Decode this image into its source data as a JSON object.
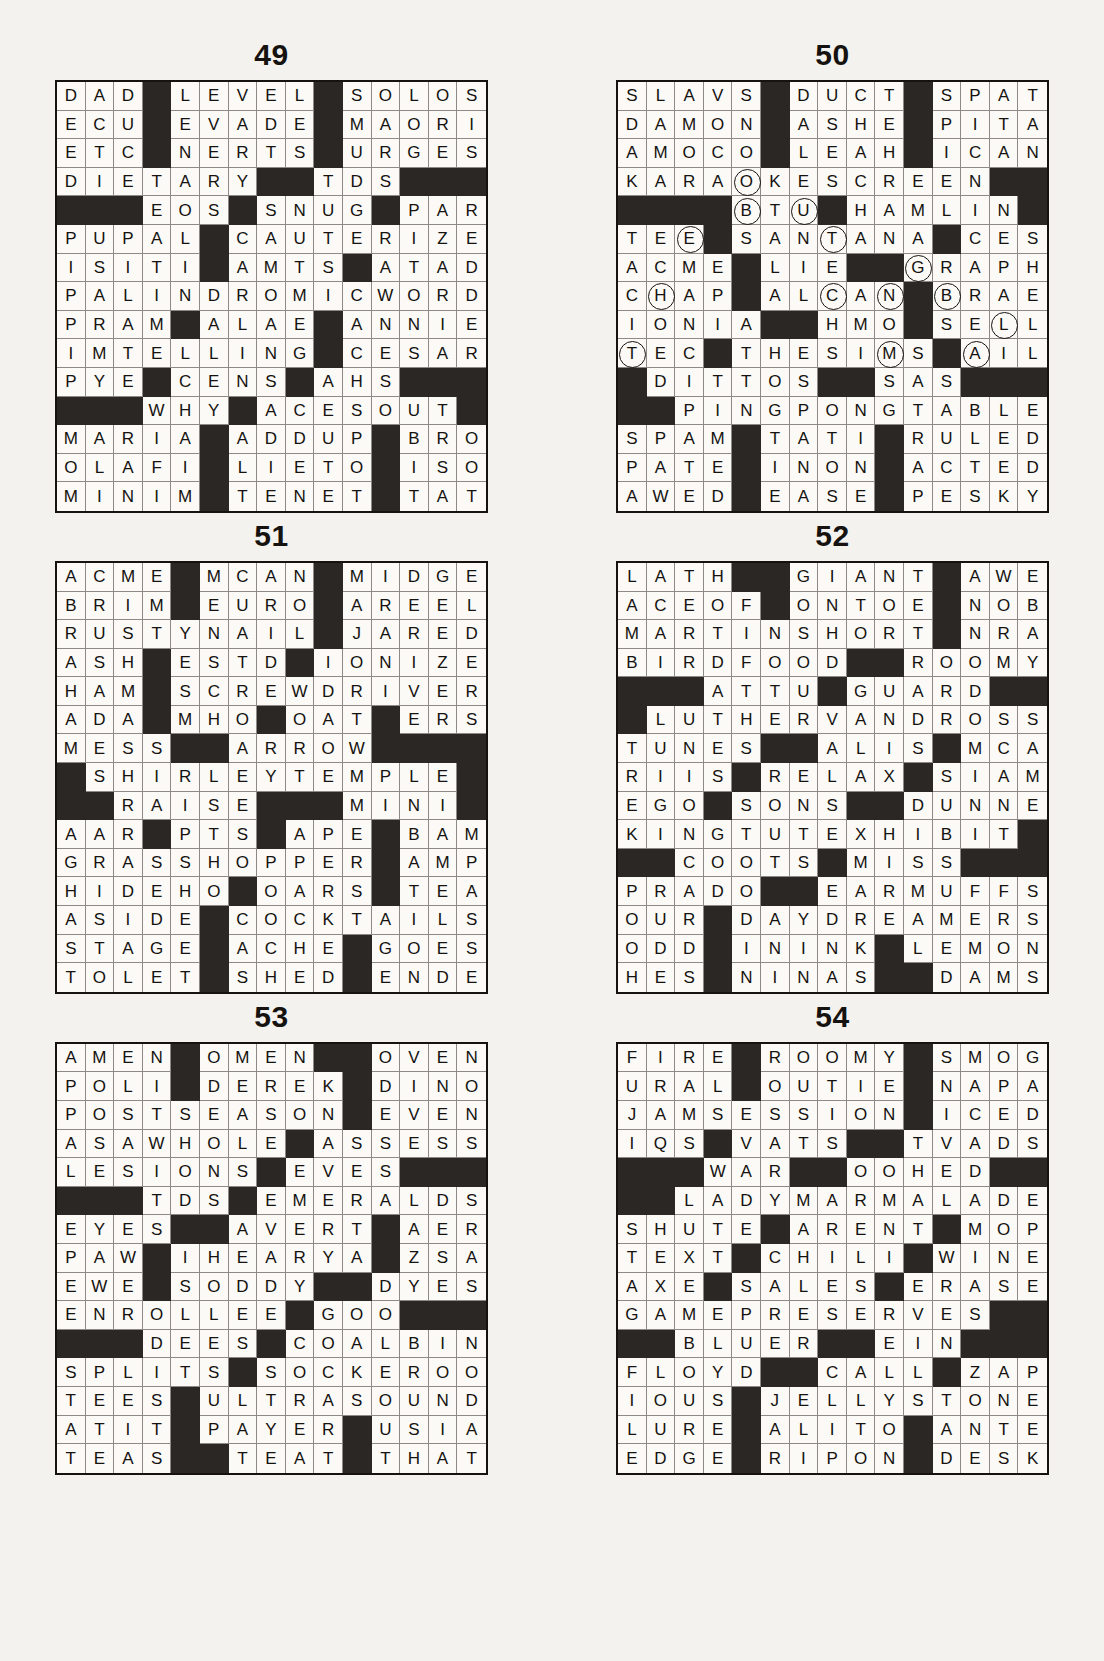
{
  "page": {
    "background_color": "#f4f2ee",
    "block_color": "#2a2724",
    "cell_color": "#fbfaf7",
    "ink_color": "#15120f",
    "grid_size": 15,
    "columns": 2,
    "rows": 3
  },
  "legend": {
    "block_symbol": "#",
    "circle_marker": "()",
    "note": "Letters enclosed in parentheses are printed inside a circle."
  },
  "puzzles": [
    {
      "number": "49",
      "has_circles": false,
      "rows": [
        "DAD#LEVEL#SOLOS",
        "ECU#EVADE#MAORI",
        "ETC#NERTS#URGES",
        "DIETARY##TDS###",
        "###EOS##SNUG#PAR",
        "PUPAL#CAUTERIZE",
        "ISITI#AMTS#ATAD",
        "PALINDROMICWORD",
        "PRAM#ALAE#ANNIE",
        "IMTELLING#CESAR",
        "PYE#CENS#AHS###",
        "###WHY##ACESOUT",
        "MARIA#ADDUP#BRO",
        "OLAFI#LIETO#ISO",
        "MINIM#TENET#TAT"
      ]
    },
    {
      "number": "50",
      "has_circles": true,
      "rows": [
        "SLAVS#DUCT##SPAT",
        "DAMON#ASHE##PITA",
        "AMOCO#LEAH##ICAN",
        "KARA(O)KESCREEN#",
        "####(B)T(U)#HAMLIN",
        "TEE(E)#SAN(N)TANA#CES",
        "ACME##LIE###(G)RAPH",
        "C(H)AP##AL(C)A(N)#(B)RAE",
        "IONIA###HMO##SE(L)L",
        "(T)EC##THESI(I)MS##(A)IL",
        "#DITTOS###SAS###",
        "##PINGPONGTABLE",
        "SPAM#TATI#RULED",
        "PATE#INON#ACTED",
        "AWED#EASE#PESKY"
      ],
      "circled_letters": [
        "O",
        "B",
        "U",
        "E",
        "N",
        "G",
        "H",
        "C",
        "N",
        "B",
        "L",
        "T",
        "I",
        "A"
      ]
    },
    {
      "number": "51",
      "has_circles": false,
      "rows": [
        "ACME#MCAN#MIDGE",
        "BRIM#EURO#AREEL",
        "RUSTYNAIL#JARED",
        "ASH#ESTD#IONIZE",
        "HAM#SCREWDRIVER",
        "ADA#MHO#OAT#ERS",
        "MESS##ARROW####",
        "#SHIRLEYTEMPLE#",
        "##RAISE###MINI#",
        "AAR#PTS#APE#BAM",
        "GRASSHOPPER#AMP",
        "HIDEHO#OARS#TEA",
        "ASIDE#COCKTAILS",
        "STAGE#ACHE#GOES",
        "TOLET#SHED#ENDE"
      ]
    },
    {
      "number": "52",
      "has_circles": false,
      "rows": [
        "LATH##GIANT#AWE",
        "ACEOF#ONTOE#NOB",
        "MARTINSHORT#NRA",
        "BIRDFOOD##ROOMY",
        "###ATTU#GUARD##",
        "#LUTHERVANDROSS",
        "TUNES##ALIS#MCA",
        "RIIS#RELAX#SIAM",
        "EGO#SONS##DUNNE",
        "KINGTUTEXHIBIT#",
        "##COOTS#MISS###",
        "PRADO##EARMUFFS",
        "OUR#DAYDREAMERS",
        "ODD#ININK#LEMON",
        "HES#NINAS##DAMS"
      ]
    },
    {
      "number": "53",
      "has_circles": false,
      "rows": [
        "AMEN#OMEN##OVEN",
        "POLI#DEREK#DINO",
        "POSTSEASON#EVEN",
        "ASAWHOLE#ASSESS",
        "LESIONS#EVES###",
        "###TDS#EMERALDS",
        "EYES##AVERT#AER",
        "PAW#IHEARYA#ZSA",
        "EWE#SODDY##DYES",
        "ENROLLEE#GOO###",
        "###DEES#COALBIN",
        "SPLITS#SOCKEROO",
        "TEES#ULTRASOUND",
        "ATIT#PAYER#USIA",
        "TEAS##TEAT#THAT"
      ]
    },
    {
      "number": "54",
      "has_circles": false,
      "rows": [
        "FIRE#ROOMY#SMOG",
        "URAL#OUTIE#NAPA",
        "JAMSESSION##ICED",
        "IQS#VATS##TVADS",
        "###WAR##OOHED##",
        "##LADYMARMALADE",
        "SHUTE#ARENT#MOP",
        "TEXT#CHILI#WINE",
        "AXE#SALES#ERASE",
        "GAMEPRESERVES##",
        "##BLUER##EIN###",
        "FLOYD##CALL#ZAP",
        "IOUS#JELLYSTONE",
        "LURE#ALITO#ANTE",
        "EDGE#RIPON#DESK"
      ]
    }
  ],
  "grid_layouts": {
    "49": [
      "DAD#LEVEL#SOLOS",
      "ECU#EVADE#MAORI",
      "ETC#NERTS#URGES",
      "DIETARY##TDS###",
      "###EOS#SNUG#PAR",
      "PUPAL#CAUTERIZE",
      "ISITI#AMTS#ATAD",
      "PALINDROMICWORD",
      "PRAM#ALAE#ANNIE",
      "IMTELLING#CESAR",
      "PYE#CENS#AHS###",
      "###WHY#ACESOUT#",
      "MARIA#ADDUP#BRO",
      "OLAFI#LIETO#ISO",
      "MINIM#TENET#TAT"
    ],
    "50": [
      "SLAVS#DUCT#SPAT",
      "DAMON#ASHE#PITA",
      "AMOCO#LEAH#ICAN",
      "KARAOKESCREEN##",
      "####BTU#HAMLIN#",
      "TEE#SANTANA#CES",
      "ACME#LIE##GRAPH",
      "CHAP#ALCAN#BRAE",
      "IONIA##HMO#SELL",
      "TEC#THESIMS#AIL",
      "#DITTOS##SAS###",
      "##PINGPONGTABLE",
      "SPAM#TATI#RULED",
      "PATE#INON#ACTED",
      "AWED#EASE#PESKY"
    ],
    "51": [
      "ACME#MCAN#MIDGE",
      "BRIM#EURO#AREEL",
      "RUSTYNAIL#JARED",
      "ASH#ESTD#IONIZE",
      "HAM#SCREWDRIVER",
      "ADA#MHO#OAT#ERS",
      "MESS##ARROW####",
      "#SHIRLEYTEMPLE#",
      "##RAISE###MINI#",
      "AAR#PTS#APE#BAM",
      "GRASSHOPPER#AMP",
      "HIDEHO#OARS#TEA",
      "ASIDE#COCKTAILS",
      "STAGE#ACHE#GOES",
      "TOLET#SHED#ENDE"
    ],
    "52": [
      "LATH##GIANT#AWE",
      "ACEOF#ONTOE#NOB",
      "MARTINSHORT#NRA",
      "BIRDFOOD##ROOMY",
      "###ATTU#GUARD##",
      "#LUTHERVANDROSS",
      "TUNES##ALIS#MCA",
      "RIIS#RELAX#SIAM",
      "EGO#SONS##DUNNE",
      "KINGTUTEXHIBIT#",
      "##COOTS#MISS###",
      "PRADO##EARMUFFS",
      "OUR#DAYDREAMERS",
      "ODD#ININK#LEMON",
      "HES#NINAS##DAMS"
    ],
    "53": [
      "AMEN#OMEN##OVEN",
      "POLI#DEREK#DINO",
      "POSTSEASON#EVEN",
      "ASAWHOLE#ASSESS",
      "LESIONS#EVES###",
      "###TDS#EMERALDS",
      "EYES##AVERT#AER",
      "PAW#IHEARYA#ZSA",
      "EWE#SODDY##DYES",
      "ENROLLEE#GOO###",
      "###DEES#COALBIN",
      "SPLITS#SOCKEROO",
      "TEES#ULTRASOUND",
      "ATIT#PAYER#USIA",
      "TEAS##TEAT#THAT"
    ],
    "54": [
      "FIRE#ROOMY#SMOG",
      "URAL#OUTIE#NAPA",
      "JAMSESSION#ICED",
      "IQS#VATS##TVADS",
      "###WAR##OOHED##",
      "##LADYMARMALADE",
      "SHUTE#ARENT#MOP",
      "TEXT#CHILI#WINE",
      "AXE#SALES#ERASE",
      "GAMEPRESERVES##",
      "##BLUER##EIN###",
      "FLOYD##CALL#ZAP",
      "IOUS#JELLYSTONE",
      "LURE#ALITO#ANTE",
      "EDGE#RIPON#DESK"
    ]
  },
  "circles": {
    "50": [
      {
        "row": 3,
        "col": 4,
        "letter": "O"
      },
      {
        "row": 4,
        "col": 4,
        "letter": "B"
      },
      {
        "row": 4,
        "col": 6,
        "letter": "U"
      },
      {
        "row": 5,
        "col": 2,
        "letter": "E"
      },
      {
        "row": 5,
        "col": 7,
        "letter": "N"
      },
      {
        "row": 6,
        "col": 10,
        "letter": "G"
      },
      {
        "row": 7,
        "col": 1,
        "letter": "H"
      },
      {
        "row": 7,
        "col": 7,
        "letter": "C"
      },
      {
        "row": 7,
        "col": 9,
        "letter": "N"
      },
      {
        "row": 7,
        "col": 11,
        "letter": "B"
      },
      {
        "row": 8,
        "col": 13,
        "letter": "L"
      },
      {
        "row": 9,
        "col": 0,
        "letter": "T"
      },
      {
        "row": 9,
        "col": 9,
        "letter": "I"
      },
      {
        "row": 9,
        "col": 12,
        "letter": "A"
      }
    ]
  }
}
